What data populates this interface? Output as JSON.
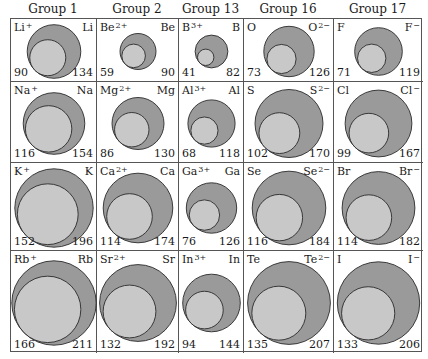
{
  "colors": {
    "larger_circle": "#9a9a9a",
    "smaller_circle": "#c8c8c8",
    "outline": "#2a2a2a",
    "grid_line": "#555555"
  },
  "columns": [
    {
      "header": "Group 1",
      "x": 0,
      "width": 86
    },
    {
      "header": "Group 2",
      "x": 86,
      "width": 82
    },
    {
      "header": "Group 13",
      "x": 168,
      "width": 65
    },
    {
      "header": "Group 16",
      "x": 233,
      "width": 90
    },
    {
      "header": "Group 17",
      "x": 323,
      "width": 89
    }
  ],
  "rows": [
    {
      "y": 0,
      "height": 63
    },
    {
      "y": 63,
      "height": 81
    },
    {
      "y": 144,
      "height": 88
    },
    {
      "y": 232,
      "height": 102
    }
  ],
  "cells": [
    [
      {
        "ion": "Li",
        "ion_charge": "+",
        "atom": "Li",
        "atom_charge": "",
        "ion_radius": "90",
        "atom_radius": "134"
      },
      {
        "ion": "Be",
        "ion_charge": "2+",
        "atom": "Be",
        "atom_charge": "",
        "ion_radius": "59",
        "atom_radius": "90"
      },
      {
        "ion": "B",
        "ion_charge": "3+",
        "atom": "B",
        "atom_charge": "",
        "ion_radius": "41",
        "atom_radius": "82"
      },
      {
        "ion": "O",
        "ion_charge": "",
        "atom": "O",
        "atom_charge": "2−",
        "ion_radius": "73",
        "atom_radius": "126"
      },
      {
        "ion": "F",
        "ion_charge": "",
        "atom": "F",
        "atom_charge": "−",
        "ion_radius": "71",
        "atom_radius": "119"
      }
    ],
    [
      {
        "ion": "Na",
        "ion_charge": "+",
        "atom": "Na",
        "atom_charge": "",
        "ion_radius": "116",
        "atom_radius": "154"
      },
      {
        "ion": "Mg",
        "ion_charge": "2+",
        "atom": "Mg",
        "atom_charge": "",
        "ion_radius": "86",
        "atom_radius": "130"
      },
      {
        "ion": "Al",
        "ion_charge": "3+",
        "atom": "Al",
        "atom_charge": "",
        "ion_radius": "68",
        "atom_radius": "118"
      },
      {
        "ion": "S",
        "ion_charge": "",
        "atom": "S",
        "atom_charge": "2−",
        "ion_radius": "102",
        "atom_radius": "170"
      },
      {
        "ion": "Cl",
        "ion_charge": "",
        "atom": "Cl",
        "atom_charge": "−",
        "ion_radius": "99",
        "atom_radius": "167"
      }
    ],
    [
      {
        "ion": "K",
        "ion_charge": "+",
        "atom": "K",
        "atom_charge": "",
        "ion_radius": "152",
        "atom_radius": "196"
      },
      {
        "ion": "Ca",
        "ion_charge": "2+",
        "atom": "Ca",
        "atom_charge": "",
        "ion_radius": "114",
        "atom_radius": "174"
      },
      {
        "ion": "Ga",
        "ion_charge": "3+",
        "atom": "Ga",
        "atom_charge": "",
        "ion_radius": "76",
        "atom_radius": "126"
      },
      {
        "ion": "Se",
        "ion_charge": "",
        "atom": "Se",
        "atom_charge": "2−",
        "ion_radius": "116",
        "atom_radius": "184"
      },
      {
        "ion": "Br",
        "ion_charge": "",
        "atom": "Br",
        "atom_charge": "−",
        "ion_radius": "114",
        "atom_radius": "182"
      }
    ],
    [
      {
        "ion": "Rb",
        "ion_charge": "+",
        "atom": "Rb",
        "atom_charge": "",
        "ion_radius": "166",
        "atom_radius": "211"
      },
      {
        "ion": "Sr",
        "ion_charge": "2+",
        "atom": "Sr",
        "atom_charge": "",
        "ion_radius": "132",
        "atom_radius": "192"
      },
      {
        "ion": "In",
        "ion_charge": "3+",
        "atom": "In",
        "atom_charge": "",
        "ion_radius": "94",
        "atom_radius": "144"
      },
      {
        "ion": "Te",
        "ion_charge": "",
        "atom": "Te",
        "atom_charge": "2−",
        "ion_radius": "135",
        "atom_radius": "207"
      },
      {
        "ion": "I",
        "ion_charge": "",
        "atom": "I",
        "atom_charge": "−",
        "ion_radius": "133",
        "atom_radius": "206"
      }
    ]
  ],
  "scale_px_per_pm": 0.2
}
